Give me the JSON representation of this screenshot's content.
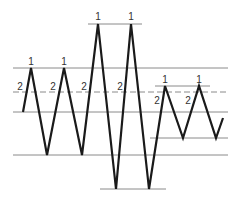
{
  "diagram": {
    "title": "",
    "colors": {
      "line": "#1a1a1a",
      "reference": "#8a8a8a",
      "label": "#333333"
    },
    "zigzag": {
      "description": "Price-like zigzag wave with peaks and troughs",
      "points": [
        {
          "id": "p0",
          "kind": "start"
        },
        {
          "id": "p1",
          "kind": "peak",
          "label": "1"
        },
        {
          "id": "p2",
          "kind": "trough"
        },
        {
          "id": "p3",
          "kind": "peak",
          "label": "1"
        },
        {
          "id": "p4",
          "kind": "trough"
        },
        {
          "id": "p5",
          "kind": "peak",
          "label": "1"
        },
        {
          "id": "p6",
          "kind": "trough"
        },
        {
          "id": "p7",
          "kind": "peak",
          "label": "1"
        },
        {
          "id": "p8",
          "kind": "trough"
        },
        {
          "id": "p9",
          "kind": "peak",
          "label": "1"
        },
        {
          "id": "p10",
          "kind": "trough"
        },
        {
          "id": "p11",
          "kind": "peak",
          "label": "1"
        },
        {
          "id": "p12",
          "kind": "trough"
        },
        {
          "id": "p13",
          "kind": "end"
        }
      ]
    },
    "labels": {
      "peak": "1",
      "midpoint": "2"
    },
    "midpoint_labels": [
      "2",
      "2",
      "2",
      "2",
      "2",
      "2"
    ],
    "peak_labels": [
      "1",
      "1",
      "1",
      "1",
      "1",
      "1"
    ],
    "reference_lines": [
      {
        "id": "top-line",
        "style": "solid"
      },
      {
        "id": "upper-line",
        "style": "solid"
      },
      {
        "id": "right-upper-line",
        "style": "solid"
      },
      {
        "id": "dashed-midline",
        "style": "dashed"
      },
      {
        "id": "middle-line",
        "style": "solid"
      },
      {
        "id": "right-lower-line",
        "style": "solid"
      },
      {
        "id": "lower-line",
        "style": "solid"
      },
      {
        "id": "bottom-line",
        "style": "solid"
      }
    ]
  }
}
